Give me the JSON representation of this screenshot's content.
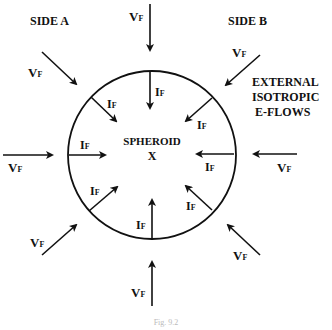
{
  "diagram": {
    "side_a": "SIDE A",
    "side_b": "SIDE B",
    "external_line1": "EXTERNAL",
    "external_line2": "ISOTROPIC",
    "external_line3": "E-FLOWS",
    "center_line1": "SPHEROID",
    "center_line2": "X",
    "v_main": "V",
    "v_sub": "F",
    "i_main": "I",
    "i_sub": "F",
    "caption": "Fig. 9.2",
    "colors": {
      "ink": "#111111",
      "background": "#ffffff"
    }
  }
}
